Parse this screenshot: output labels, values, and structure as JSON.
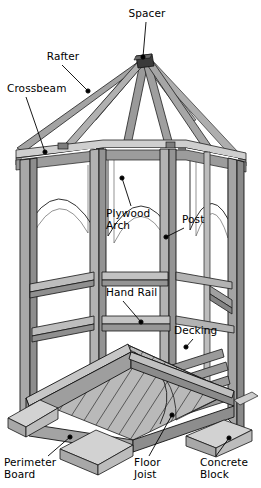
{
  "diagram": {
    "type": "technical-line-drawing",
    "view": "isometric cutaway",
    "colors": {
      "background": "#ffffff",
      "outline": "#1a1a1a",
      "wood_light": "#c9c9c9",
      "wood_mid": "#a9a9a9",
      "wood_dark": "#8a8a8a",
      "wood_shadow": "#6e6e6e",
      "concrete": "#bdbdbd",
      "label_text": "#000000",
      "leader_line": "#000000"
    },
    "labels": [
      {
        "id": "spacer",
        "text": "Spacer",
        "x": 121,
        "y": 8,
        "w": 52,
        "align": "center",
        "leader": {
          "x1": 146,
          "y1": 22,
          "x2": 143,
          "y2": 57
        },
        "dot": {
          "x": 143,
          "y": 57
        }
      },
      {
        "id": "rafter",
        "text": "Rafter",
        "x": 40,
        "y": 51,
        "w": 46,
        "align": "center",
        "leader": {
          "x1": 62,
          "y1": 65,
          "x2": 88,
          "y2": 91
        },
        "dot": {
          "x": 88,
          "y": 91
        }
      },
      {
        "id": "crossbeam",
        "text": "Crossbeam",
        "x": 7,
        "y": 83,
        "w": 60,
        "align": "left",
        "leader": {
          "x1": 26,
          "y1": 97,
          "x2": 45,
          "y2": 152
        },
        "dot": {
          "x": 45,
          "y": 152
        }
      },
      {
        "id": "plywood-arch",
        "text": "Plywood\nArch",
        "x": 106,
        "y": 208,
        "w": 52,
        "align": "left",
        "leader": {
          "x1": 131,
          "y1": 206,
          "x2": 122,
          "y2": 178
        },
        "dot": {
          "x": 122,
          "y": 178
        }
      },
      {
        "id": "post",
        "text": "Post",
        "x": 182,
        "y": 214,
        "w": 32,
        "align": "left",
        "leader": {
          "x1": 184,
          "y1": 228,
          "x2": 166,
          "y2": 237
        },
        "dot": {
          "x": 166,
          "y": 237
        }
      },
      {
        "id": "hand-rail",
        "text": "Hand Rail",
        "x": 106,
        "y": 287,
        "w": 54,
        "align": "left",
        "leader": {
          "x1": 123,
          "y1": 301,
          "x2": 141,
          "y2": 322
        },
        "dot": {
          "x": 141,
          "y": 322
        }
      },
      {
        "id": "decking",
        "text": "Decking",
        "x": 174,
        "y": 325,
        "w": 46,
        "align": "left",
        "leader": {
          "x1": 193,
          "y1": 339,
          "x2": 186,
          "y2": 347
        },
        "dot": {
          "x": 186,
          "y": 347
        }
      },
      {
        "id": "perimeter-board",
        "text": "Perimeter\nBoard",
        "x": 4,
        "y": 457,
        "w": 58,
        "align": "left",
        "leader": {
          "x1": 48,
          "y1": 456,
          "x2": 70,
          "y2": 437
        },
        "dot": {
          "x": 70,
          "y": 437
        }
      },
      {
        "id": "floor-joist",
        "text": "Floor\nJoist",
        "x": 134,
        "y": 457,
        "w": 38,
        "align": "left",
        "leader": {
          "x1": 149,
          "y1": 456,
          "x2": 172,
          "y2": 415
        },
        "dot": {
          "x": 172,
          "y": 415
        }
      },
      {
        "id": "concrete-block",
        "text": "Concrete\nBlock",
        "x": 200,
        "y": 457,
        "w": 54,
        "align": "left",
        "leader": {
          "x1": 216,
          "y1": 456,
          "x2": 229,
          "y2": 438
        },
        "dot": {
          "x": 229,
          "y": 438
        }
      }
    ]
  }
}
